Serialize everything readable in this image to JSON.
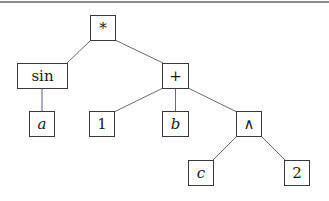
{
  "diagram": {
    "type": "expression-tree",
    "expression": "sin(a) * (1 + b + c ∧ 2)",
    "nodes": [
      {
        "id": "mul",
        "label": "*",
        "kind": "op",
        "x": 90,
        "y": 15,
        "w": 26,
        "h": 26
      },
      {
        "id": "sin",
        "label": "sin",
        "kind": "op",
        "x": 17,
        "y": 63,
        "w": 51,
        "h": 26
      },
      {
        "id": "plus",
        "label": "+",
        "kind": "op",
        "x": 162,
        "y": 63,
        "w": 27,
        "h": 26
      },
      {
        "id": "a",
        "label": "a",
        "kind": "var",
        "x": 29,
        "y": 111,
        "w": 26,
        "h": 26
      },
      {
        "id": "one",
        "label": "1",
        "kind": "const",
        "x": 89,
        "y": 111,
        "w": 26,
        "h": 26
      },
      {
        "id": "b",
        "label": "b",
        "kind": "var",
        "x": 162,
        "y": 111,
        "w": 27,
        "h": 26
      },
      {
        "id": "pow",
        "label": "∧",
        "kind": "op",
        "x": 236,
        "y": 111,
        "w": 26,
        "h": 26
      },
      {
        "id": "c",
        "label": "c",
        "kind": "var",
        "x": 188,
        "y": 160,
        "w": 26,
        "h": 26
      },
      {
        "id": "two",
        "label": "2",
        "kind": "const",
        "x": 284,
        "y": 160,
        "w": 26,
        "h": 26
      }
    ],
    "edges": [
      {
        "from": "mul",
        "to": "sin"
      },
      {
        "from": "mul",
        "to": "plus"
      },
      {
        "from": "sin",
        "to": "a"
      },
      {
        "from": "plus",
        "to": "one"
      },
      {
        "from": "plus",
        "to": "b"
      },
      {
        "from": "plus",
        "to": "pow"
      },
      {
        "from": "pow",
        "to": "c"
      },
      {
        "from": "pow",
        "to": "two"
      }
    ],
    "colors": {
      "edge": "#6b6b6b",
      "edge_sin_a": "#5a5a8a",
      "border": "#3a3a3a",
      "top_rule": "#8a8a8a"
    }
  }
}
